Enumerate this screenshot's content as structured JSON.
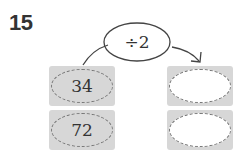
{
  "problem": {
    "number": "15",
    "operation": "÷2",
    "inputs": [
      "34",
      "72"
    ],
    "outputs": [
      "",
      ""
    ]
  },
  "colors": {
    "box_fill": "#d7d7d7",
    "dash": "#777777",
    "text": "#333333"
  }
}
